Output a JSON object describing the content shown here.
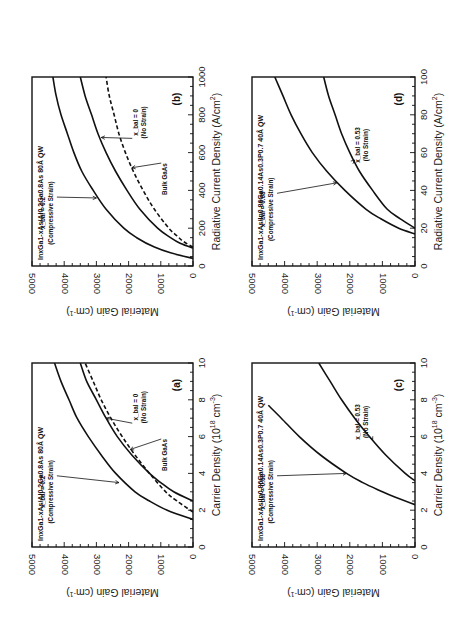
{
  "figure": {
    "orientation": "rotated 90 degrees counter-clockwise",
    "layout": "2x2 panels"
  },
  "chart_data": [
    {
      "panel": "a",
      "type": "line",
      "title": "InxGa1-xAs/Al0.2Ga0.8As 80Å QW",
      "title_parts": {
        "main": [
          "In",
          "Ga",
          "As/Al",
          "Ga",
          "As 80Å  QW"
        ],
        "subs": [
          "x",
          "1-x",
          "0.2",
          "0.8"
        ]
      },
      "xlabel": "Carrier Density (10^18 cm^-3)",
      "xlabel_text": "Carrier Density (10",
      "xlabel_sup": "18",
      "xlabel_tail": " cm",
      "xlabel_sup2": "-3",
      "xlabel_end": ")",
      "ylabel": "Material Gain (cm^-1)",
      "ylabel_text": "Material Gain (cm",
      "ylabel_sup": "-1",
      "ylabel_end": ")",
      "xlim": [
        0,
        10
      ],
      "ylim": [
        0,
        5000
      ],
      "xticks": [
        0,
        2,
        4,
        6,
        8,
        10
      ],
      "yticks": [
        0,
        1000,
        2000,
        3000,
        4000,
        5000
      ],
      "panel_label": "(a)",
      "series": [
        {
          "name": "x_bal = 0.2 (Compressive Strain)",
          "style": "solid",
          "x": [
            1.5,
            2.0,
            2.5,
            3.0,
            4.0,
            5.0,
            6.0,
            7.0,
            8.0,
            9.0,
            10.0
          ],
          "y": [
            0,
            800,
            1350,
            1800,
            2400,
            2850,
            3250,
            3600,
            3850,
            4100,
            4300
          ]
        },
        {
          "name": "x_bal = 0 (No Strain)",
          "style": "solid",
          "x": [
            2.5,
            3.0,
            3.5,
            4.0,
            5.0,
            6.0,
            7.0,
            8.0,
            9.0,
            10.0
          ],
          "y": [
            0,
            600,
            1000,
            1350,
            1900,
            2350,
            2700,
            3000,
            3300,
            3500
          ]
        },
        {
          "name": "Bulk GaAs",
          "style": "dashed",
          "x": [
            1.9,
            2.5,
            3.0,
            4.0,
            5.0,
            6.0,
            7.0,
            8.0,
            9.0,
            10.0
          ],
          "y": [
            0,
            500,
            850,
            1350,
            1800,
            2200,
            2550,
            2850,
            3100,
            3350
          ]
        }
      ],
      "annotations": [
        {
          "label": "x_bal = 0.2",
          "sub": "(Compressive Strain)"
        },
        {
          "label": "x_bal = 0",
          "sub": "(No Strain)"
        },
        {
          "label": "Bulk GaAs"
        }
      ]
    },
    {
      "panel": "b",
      "type": "line",
      "title": "InxGa1-xAs/Al0.2Ga0.8As 80Å QW",
      "xlabel": "Radiative Current Density (A/cm^2)",
      "xlabel_text": "Radiative Current Density (A/cm",
      "xlabel_sup": "2",
      "xlabel_end": ")",
      "ylabel": "Material Gain (cm^-1)",
      "ylabel_text": "Material Gain (cm",
      "ylabel_sup": "-1",
      "ylabel_end": ")",
      "xlim": [
        0,
        1000
      ],
      "ylim": [
        0,
        5000
      ],
      "xticks": [
        0,
        200,
        400,
        600,
        800,
        1000
      ],
      "yticks": [
        0,
        1000,
        2000,
        3000,
        4000,
        5000
      ],
      "panel_label": "(b)",
      "series": [
        {
          "name": "x_bal = 0.2 (Compressive Strain)",
          "style": "solid",
          "x": [
            40,
            70,
            100,
            150,
            200,
            300,
            400,
            500,
            600,
            700,
            800,
            900,
            1000
          ],
          "y": [
            0,
            700,
            1200,
            1750,
            2150,
            2700,
            3100,
            3450,
            3700,
            3900,
            4100,
            4250,
            4350
          ]
        },
        {
          "name": "x_bal = 0 (No Strain)",
          "style": "solid",
          "x": [
            95,
            120,
            150,
            200,
            300,
            400,
            500,
            600,
            700,
            800,
            900,
            1000
          ],
          "y": [
            0,
            400,
            700,
            1100,
            1650,
            2050,
            2400,
            2700,
            2950,
            3150,
            3350,
            3500
          ]
        },
        {
          "name": "Bulk GaAs",
          "style": "dashed",
          "x": [
            100,
            130,
            160,
            200,
            300,
            400,
            500,
            600,
            700,
            800,
            900,
            1000
          ],
          "y": [
            0,
            300,
            500,
            750,
            1200,
            1550,
            1850,
            2100,
            2300,
            2450,
            2600,
            2700
          ]
        }
      ],
      "annotations": [
        {
          "label": "x_bal = 0.2",
          "sub": "(Compressive Strain)"
        },
        {
          "label": "x_bal = 0",
          "sub": "(No Strain)"
        },
        {
          "label": "Bulk GaAs"
        }
      ]
    },
    {
      "panel": "c",
      "type": "line",
      "title": "InxGa1-xAs/In0.86Ga0.14As0.3P0.7 40Å QW",
      "xlabel": "Carrier Density (10^18 cm^-3)",
      "xlabel_text": "Carrier Density (10",
      "xlabel_sup": "18",
      "xlabel_tail": " cm",
      "xlabel_sup2": "-3",
      "xlabel_end": ")",
      "ylabel": "Material Gain (cm^-1)",
      "ylabel_text": "Material Gain (cm",
      "ylabel_sup": "-1",
      "ylabel_end": ")",
      "xlim": [
        0,
        10
      ],
      "ylim": [
        0,
        5000
      ],
      "xticks": [
        0,
        2,
        4,
        6,
        8,
        10
      ],
      "yticks": [
        0,
        1000,
        2000,
        3000,
        4000,
        5000
      ],
      "panel_label": "(c)",
      "series": [
        {
          "name": "x_bal = 0.68 (Compressive Strain)",
          "style": "solid",
          "x": [
            2.3,
            2.7,
            3.0,
            3.5,
            4.0,
            5.0,
            6.0,
            7.0,
            7.7
          ],
          "y": [
            0,
            600,
            1000,
            1600,
            2100,
            2900,
            3550,
            4100,
            4500
          ]
        },
        {
          "name": "x_bal = 0.53 (No Strain)",
          "style": "solid",
          "x": [
            3.6,
            4.0,
            5.0,
            6.0,
            7.0,
            8.0,
            9.0,
            10.0
          ],
          "y": [
            0,
            300,
            900,
            1400,
            1850,
            2250,
            2600,
            2950
          ]
        }
      ],
      "annotations": [
        {
          "label": "x_bal = 0.68",
          "sub": "(Compressive Strain)"
        },
        {
          "label": "x_bal = 0.53",
          "sub": "(No Strain)"
        }
      ]
    },
    {
      "panel": "d",
      "type": "line",
      "title": "InxGa1-xAs/In0.86Ga0.14As0.3P0.7 40Å QW",
      "xlabel": "Radiative Current Density (A/cm^2)",
      "xlabel_text": "Radiative Current Density (A/cm",
      "xlabel_sup": "2",
      "xlabel_end": ")",
      "ylabel": "Material Gain (cm^-1)",
      "ylabel_text": "Material Gain (cm",
      "ylabel_sup": "-1",
      "ylabel_end": ")",
      "xlim": [
        0,
        100
      ],
      "ylim": [
        0,
        5000
      ],
      "xticks": [
        0,
        20,
        40,
        60,
        80,
        100
      ],
      "yticks": [
        0,
        1000,
        2000,
        3000,
        4000,
        5000
      ],
      "panel_label": "(d)",
      "series": [
        {
          "name": "x_bal = 0.68 (Compressive Strain)",
          "style": "solid",
          "x": [
            17,
            20,
            25,
            30,
            40,
            50,
            60,
            70,
            80,
            90,
            100
          ],
          "y": [
            0,
            500,
            1050,
            1500,
            2150,
            2700,
            3150,
            3500,
            3800,
            4050,
            4300
          ]
        },
        {
          "name": "x_bal = 0.53 (No Strain)",
          "style": "solid",
          "x": [
            20,
            25,
            30,
            40,
            50,
            60,
            70,
            80,
            90,
            100
          ],
          "y": [
            0,
            450,
            850,
            1300,
            1700,
            2000,
            2250,
            2450,
            2650,
            2800
          ]
        }
      ],
      "annotations": [
        {
          "label": "x_bal = 0.68",
          "sub": "(Compressive Strain)"
        },
        {
          "label": "x_bal = 0.53",
          "sub": "(No Strain)"
        }
      ]
    }
  ]
}
